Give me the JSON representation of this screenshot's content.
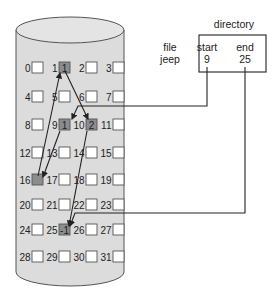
{
  "directory": {
    "title": "directory",
    "headers": {
      "file": "file",
      "start": "start",
      "end": "end"
    },
    "row": {
      "file": "jeep",
      "start": "9",
      "end": "25"
    }
  },
  "disk": {
    "blocks": [
      {
        "n": "0"
      },
      {
        "n": "1",
        "value": "1",
        "used": true
      },
      {
        "n": "2"
      },
      {
        "n": "3"
      },
      {
        "n": "4"
      },
      {
        "n": "5"
      },
      {
        "n": "6"
      },
      {
        "n": "7"
      },
      {
        "n": "8"
      },
      {
        "n": "9",
        "value": "1",
        "used": true
      },
      {
        "n": "10",
        "value": "2",
        "used": true
      },
      {
        "n": "11"
      },
      {
        "n": "12"
      },
      {
        "n": "13"
      },
      {
        "n": "14"
      },
      {
        "n": "15"
      },
      {
        "n": "16",
        "value": "",
        "used": true
      },
      {
        "n": "17"
      },
      {
        "n": "18"
      },
      {
        "n": "19"
      },
      {
        "n": "20"
      },
      {
        "n": "21"
      },
      {
        "n": "22"
      },
      {
        "n": "23"
      },
      {
        "n": "24"
      },
      {
        "n": "25",
        "value": "-1",
        "used": true
      },
      {
        "n": "26"
      },
      {
        "n": "27"
      },
      {
        "n": "28"
      },
      {
        "n": "29"
      },
      {
        "n": "30"
      },
      {
        "n": "31"
      }
    ],
    "chain": [
      "9",
      "16",
      "1",
      "10",
      "25"
    ]
  },
  "colors": {
    "cylinder_fill": "#dcdcdc",
    "cylinder_stroke": "#555555",
    "used_block": "#8c8c8c",
    "free_block": "#ffffff",
    "line": "#222222"
  }
}
